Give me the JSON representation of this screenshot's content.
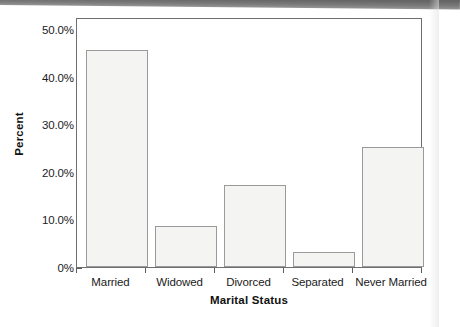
{
  "chart_data": {
    "type": "bar",
    "title": "",
    "subtitle": "",
    "xlabel": "Marital Status",
    "ylabel": "Percent",
    "categories": [
      "Married",
      "Widowed",
      "Divorced",
      "Separated",
      "Never Married"
    ],
    "values": [
      46.0,
      8.6,
      17.4,
      3.2,
      25.4
    ],
    "value_labels": [
      "",
      "",
      "",
      "",
      ""
    ],
    "ylim": [
      0,
      52.5
    ],
    "ytick_values": [
      0,
      10,
      20,
      30,
      40,
      50
    ],
    "ytick_labels": [
      "0%",
      "10.0%",
      "20.0%",
      "30.0%",
      "40.0%",
      "50.0%"
    ],
    "grid": false,
    "legend": null,
    "legend_position": "none",
    "bar_fill_color": "#f4f4f2",
    "bar_edge_color": "#9a9a9a",
    "axis_color": "#6e6e6e",
    "text_color": "#1b1b1b"
  },
  "axes": {
    "y_title": "Percent",
    "x_title": "Marital Status"
  }
}
